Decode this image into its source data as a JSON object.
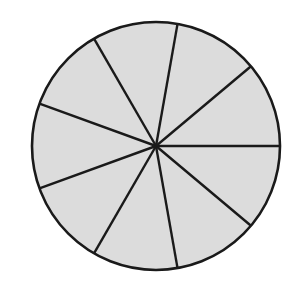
{
  "figure": {
    "kind": "fraction-circle-diagram",
    "background_color": "#ffffff",
    "width": 292,
    "height": 288
  },
  "chart_data": {
    "type": "pie",
    "title": "",
    "subtitle": "",
    "xlabel": "",
    "ylabel": "",
    "grid": false,
    "legend": "none",
    "annotations": [],
    "slice_count": 9,
    "slice_angle_degrees": 40,
    "total_degrees": 360,
    "all_slices_equal": true,
    "shaded_slice_count": 9,
    "unshaded_slice_count": 0,
    "fraction_shaded": "9/9",
    "categories": [
      "sector-1",
      "sector-2",
      "sector-3",
      "sector-4",
      "sector-5",
      "sector-6",
      "sector-7",
      "sector-8",
      "sector-9"
    ],
    "values": [
      40,
      40,
      40,
      40,
      40,
      40,
      40,
      40,
      40
    ],
    "tick_labels": [],
    "slices": [
      {
        "index": 1,
        "start_deg": 0,
        "end_deg": 40,
        "shaded": true,
        "fill": "#dcdcdc"
      },
      {
        "index": 2,
        "start_deg": 40,
        "end_deg": 80,
        "shaded": true,
        "fill": "#dcdcdc"
      },
      {
        "index": 3,
        "start_deg": 80,
        "end_deg": 120,
        "shaded": true,
        "fill": "#dcdcdc"
      },
      {
        "index": 4,
        "start_deg": 120,
        "end_deg": 160,
        "shaded": true,
        "fill": "#dcdcdc"
      },
      {
        "index": 5,
        "start_deg": 160,
        "end_deg": 200,
        "shaded": true,
        "fill": "#dcdcdc"
      },
      {
        "index": 6,
        "start_deg": 200,
        "end_deg": 240,
        "shaded": true,
        "fill": "#dcdcdc"
      },
      {
        "index": 7,
        "start_deg": 240,
        "end_deg": 280,
        "shaded": true,
        "fill": "#dcdcdc"
      },
      {
        "index": 8,
        "start_deg": 280,
        "end_deg": 320,
        "shaded": true,
        "fill": "#dcdcdc"
      },
      {
        "index": 9,
        "start_deg": 320,
        "end_deg": 360,
        "shaded": true,
        "fill": "#dcdcdc"
      }
    ]
  },
  "geometry": {
    "center_x": 156,
    "center_y": 146,
    "radius": 124,
    "outline_width": 2.6,
    "spoke_width": 2.4,
    "start_angle_deg": 0
  },
  "colors": {
    "fill": "#dcdcdc",
    "outline": "#1a1a1a",
    "spoke": "#1a1a1a",
    "background": "#ffffff"
  }
}
